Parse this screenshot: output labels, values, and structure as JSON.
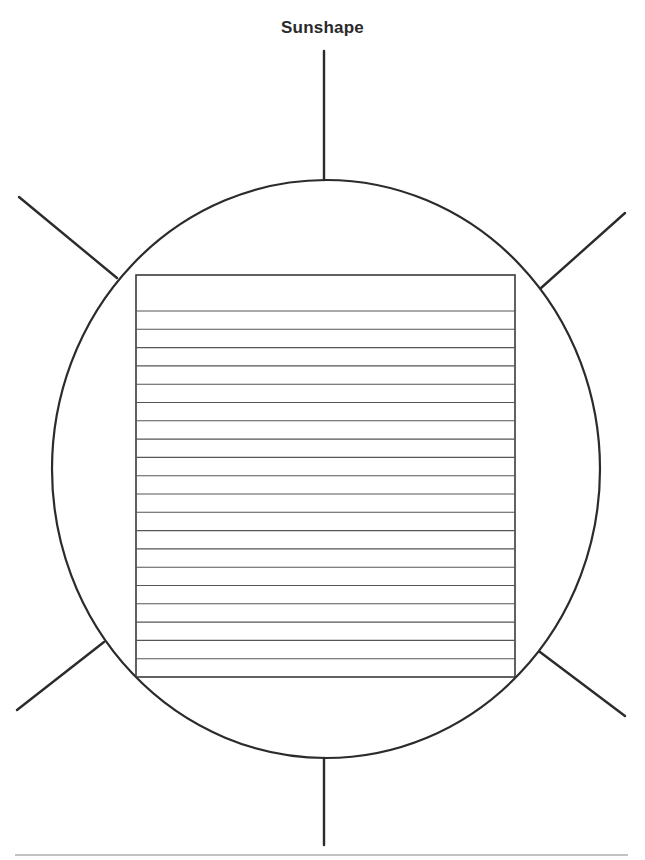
{
  "page": {
    "title": "Sunshape"
  },
  "diagram": {
    "type": "sun-shaped graphic organizer",
    "colors": {
      "stroke": "#2b2b2b",
      "ruled_line": "#555555",
      "background": "#ffffff"
    },
    "sun_circle": {
      "cx": 326,
      "cy": 469,
      "rx": 274,
      "ry": 289
    },
    "writing_box": {
      "x": 136,
      "y": 275,
      "width": 379,
      "height": 402,
      "ruled_lines": 20
    },
    "rays": [
      {
        "id": "top",
        "x1": 324,
        "y1": 51,
        "x2": 324,
        "y2": 180
      },
      {
        "id": "upper-left",
        "x1": 19,
        "y1": 197,
        "x2": 117,
        "y2": 278
      },
      {
        "id": "upper-right",
        "x1": 625,
        "y1": 213,
        "x2": 541,
        "y2": 288
      },
      {
        "id": "lower-left",
        "x1": 17,
        "y1": 710,
        "x2": 104,
        "y2": 642
      },
      {
        "id": "lower-right",
        "x1": 625,
        "y1": 716,
        "x2": 540,
        "y2": 652
      },
      {
        "id": "bottom",
        "x1": 324,
        "y1": 758,
        "x2": 324,
        "y2": 845
      }
    ],
    "footer_rule": {
      "x1": 15,
      "y1": 855,
      "x2": 628,
      "y2": 855
    }
  }
}
